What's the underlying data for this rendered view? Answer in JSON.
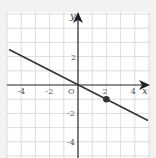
{
  "chart_data": {
    "type": "line",
    "title": "",
    "xlabel": "x",
    "ylabel": "y",
    "origin_label": "O",
    "xlim": [
      -5,
      5
    ],
    "ylim": [
      -5,
      5
    ],
    "grid": true,
    "x_ticks": [
      "-4",
      "-2",
      "2",
      "4"
    ],
    "y_ticks": [
      "2",
      "-2",
      "-4"
    ],
    "series": [
      {
        "name": "line",
        "equation": "y = -x/2",
        "x": [
          -5,
          5
        ],
        "y": [
          2.5,
          -2.5
        ]
      }
    ],
    "points": [
      {
        "x": 2,
        "y": -1
      }
    ]
  },
  "colors": {
    "line": "#333333",
    "grid": "#cfcfcf",
    "axis": "#222222",
    "background": "#ffffff"
  }
}
